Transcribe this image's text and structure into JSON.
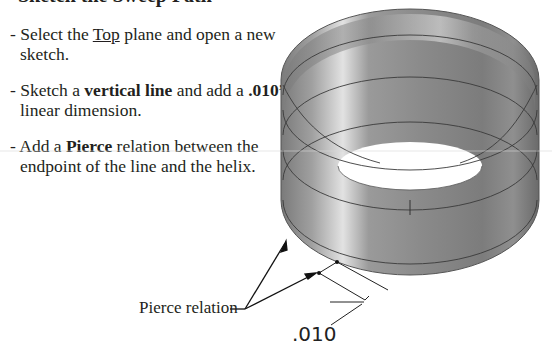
{
  "heading": {
    "text": "Sketch the Sweep Path"
  },
  "steps": [
    {
      "prefix": "- Select the ",
      "emph": "Top",
      "emph_style": "underline",
      "suffix": " plane and open a new sketch."
    },
    {
      "prefix": "- Sketch a ",
      "emph": "vertical line",
      "emph_style": "bold",
      "middle": " and add a ",
      "emph2": ".010”",
      "suffix": " linear dimension."
    },
    {
      "prefix": "- Add a ",
      "emph": "Pierce",
      "emph_style": "bold",
      "suffix": " relation between the endpoint of the line and the helix."
    }
  ],
  "figure": {
    "callout_label": "Pierce relation",
    "dimension_value": ".010",
    "colors": {
      "cylinder_dark": "#6e6e6e",
      "cylinder_light": "#d8d8d8",
      "helix_line": "#3a3a3a",
      "annotation": "#222222"
    }
  }
}
